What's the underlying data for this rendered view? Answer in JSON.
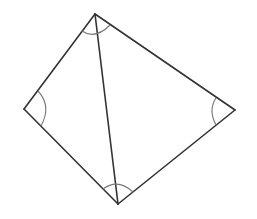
{
  "diagram": {
    "type": "quadrilateral-with-diagonal",
    "labels": [],
    "colors": {
      "edge": "#333333",
      "arc": "#777777",
      "background": "#ffffff"
    },
    "vertices": {
      "top": [
        95,
        14
      ],
      "left": [
        24,
        109
      ],
      "right": [
        235,
        110
      ],
      "bottom": [
        118,
        204
      ]
    },
    "edges": [
      [
        "top",
        "left"
      ],
      [
        "left",
        "bottom"
      ],
      [
        "bottom",
        "right"
      ],
      [
        "right",
        "top"
      ],
      [
        "top",
        "bottom"
      ]
    ],
    "angle_marks": [
      "top",
      "left",
      "right",
      "bottom"
    ]
  }
}
